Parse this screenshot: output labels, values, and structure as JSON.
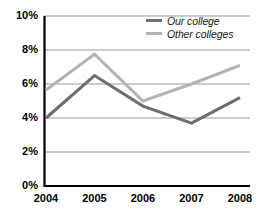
{
  "chart_data": {
    "type": "line",
    "title": "",
    "xlabel": "",
    "ylabel": "",
    "categories": [
      "2004",
      "2005",
      "2006",
      "2007",
      "2008"
    ],
    "x": [
      2004,
      2005,
      2006,
      2007,
      2008
    ],
    "series": [
      {
        "name": "Our college",
        "color": "#6e6e6e",
        "values": [
          4.0,
          6.5,
          4.7,
          3.7,
          5.2
        ]
      },
      {
        "name": "Other colleges",
        "color": "#b3b3b3",
        "values": [
          5.65,
          7.75,
          5.0,
          6.0,
          7.1
        ]
      }
    ],
    "ylim": [
      0,
      10
    ],
    "ytick_values": [
      0,
      2,
      4,
      6,
      8,
      10
    ],
    "ytick_labels": [
      "0%",
      "2%",
      "4%",
      "6%",
      "8%",
      "10%"
    ],
    "xtick_labels": [
      "2004",
      "2005",
      "2006",
      "2007",
      "2008"
    ],
    "grid": "horizontal",
    "gridline_color": "#9a9a9a",
    "axis_color": "#000000",
    "legend_position": "top-right",
    "legend": [
      "Our college",
      "Other colleges"
    ]
  },
  "legend": {
    "items": [
      {
        "label": "Our college",
        "swatch": "line-swatch-dark"
      },
      {
        "label": "Other colleges",
        "swatch": "line-swatch-light"
      }
    ]
  },
  "axes": {
    "y_labels": [
      "10%",
      "8%",
      "6%",
      "4%",
      "2%",
      "0%"
    ],
    "x_labels": [
      "2004",
      "2005",
      "2006",
      "2007",
      "2008"
    ]
  }
}
